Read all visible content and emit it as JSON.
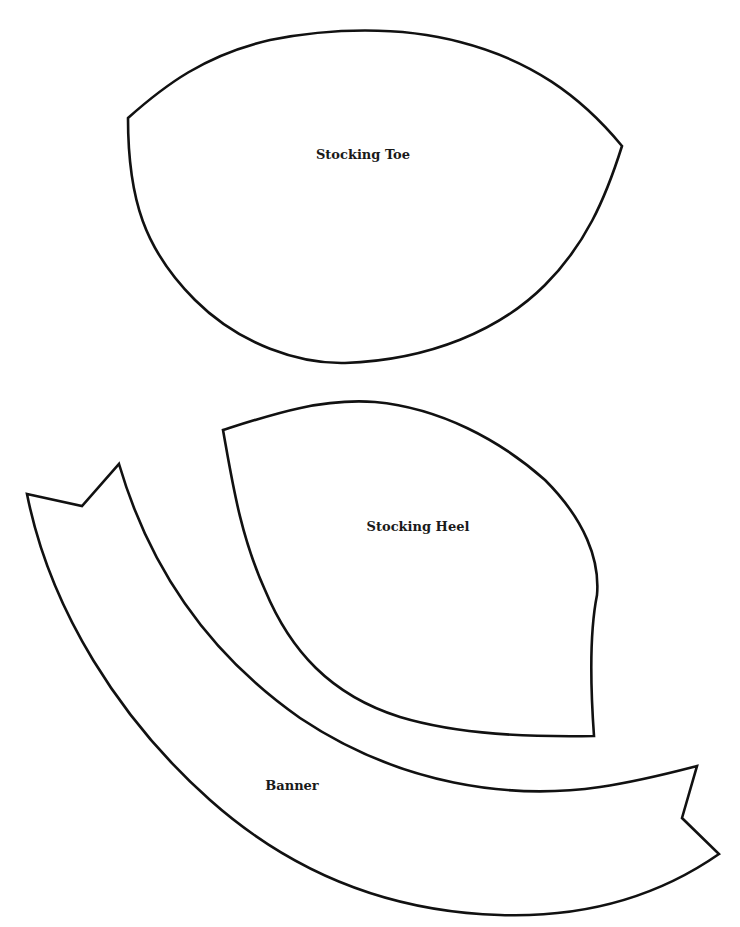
{
  "document": {
    "type": "pattern-template",
    "pieces": [
      {
        "id": "toe",
        "label": "Stocking Toe"
      },
      {
        "id": "heel",
        "label": "Stocking Heel"
      },
      {
        "id": "banner",
        "label": "Banner"
      }
    ]
  },
  "colors": {
    "background": "#ffffff",
    "outline": "#111111",
    "label": "#1a1a1a"
  }
}
